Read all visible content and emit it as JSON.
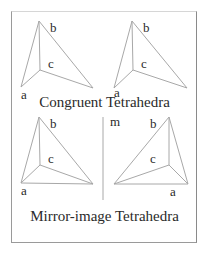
{
  "figure": {
    "top_caption": "Congruent Tetrahedra",
    "bottom_caption": "Mirror-image Tetrahedra",
    "mirror_label": "m",
    "colors": {
      "line": "#a8a8a8",
      "text": "#2a2a2a",
      "border": "#9a9a9a",
      "background": "#ffffff"
    },
    "tetrahedra": [
      {
        "position": "top-left",
        "labels": {
          "a": "a",
          "b": "b",
          "c": "c"
        }
      },
      {
        "position": "top-right",
        "labels": {
          "a": "a",
          "b": "b",
          "c": "c"
        }
      },
      {
        "position": "bottom-left",
        "labels": {
          "a": "a",
          "b": "b",
          "c": "c"
        }
      },
      {
        "position": "bottom-right",
        "labels": {
          "a": "a",
          "b": "b",
          "c": "c"
        }
      }
    ]
  }
}
